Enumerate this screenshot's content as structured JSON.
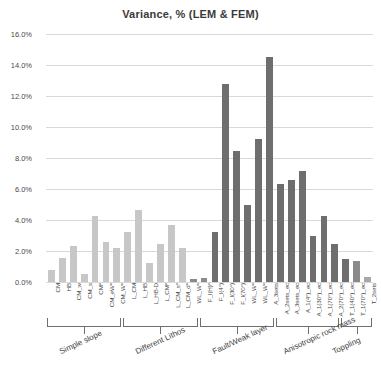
{
  "chart_data": {
    "type": "bar",
    "title": "Variance, % (LEM & FEM)",
    "xlabel": "",
    "ylabel": "",
    "ylim": [
      0,
      16
    ],
    "y_tick_labels": [
      "0.0%",
      "2.0%",
      "4.0%",
      "6.0%",
      "8.0%",
      "10.0%",
      "12.0%",
      "14.0%",
      "16.0%"
    ],
    "y_ticks": [
      0,
      2,
      4,
      6,
      8,
      10,
      12,
      14,
      16
    ],
    "grid": true,
    "legend": "none",
    "categories": [
      "CM",
      "HB",
      "CM_w",
      "CM_s",
      "CM*",
      "CM_eW*",
      "CM_W*",
      "L_CM",
      "L_HB",
      "L_HB-D",
      "L_CM*",
      "L_CM_s*",
      "L_CM_d*",
      "WL_W*",
      "F_I(H)*",
      "F_I(4°)",
      "F_I(30°)",
      "F_I(70°)",
      "WL_W*",
      "WL_W*",
      "A_3sets",
      "A_2sets_ec",
      "A_3sets_ec",
      "A_1(4°)_ec",
      "A_1(30°)_ec",
      "A_1(70°)_ec",
      "A_2(70°)_ec",
      "T_1(40°)_ec",
      "T_1(70°)_ec",
      "T_2sets"
    ],
    "values": [
      0.75,
      1.55,
      2.35,
      0.5,
      4.25,
      2.6,
      2.2,
      3.25,
      4.65,
      1.2,
      2.45,
      3.65,
      2.2,
      0.2,
      0.25,
      3.2,
      12.8,
      8.45,
      4.95,
      9.25,
      14.5,
      6.3,
      6.55,
      7.15,
      3.0,
      4.25,
      2.45,
      1.5,
      1.35,
      0.35
    ],
    "bar_colors": [
      "#c7c7c7",
      "#c7c7c7",
      "#c7c7c7",
      "#c7c7c7",
      "#c7c7c7",
      "#c7c7c7",
      "#c7c7c7",
      "#c7c7c7",
      "#c7c7c7",
      "#c7c7c7",
      "#c7c7c7",
      "#c7c7c7",
      "#c7c7c7",
      "#8a8a8a",
      "#8a8a8a",
      "#6e6e6e",
      "#6e6e6e",
      "#6e6e6e",
      "#6e6e6e",
      "#6e6e6e",
      "#6e6e6e",
      "#6e6e6e",
      "#6e6e6e",
      "#6e6e6e",
      "#6e6e6e",
      "#6e6e6e",
      "#6e6e6e",
      "#6e6e6e",
      "#8a8a8a",
      "#a8a8a8"
    ],
    "groups": [
      {
        "label": "Simple slope",
        "start": 0,
        "end": 6
      },
      {
        "label": "Different Lithos",
        "start": 7,
        "end": 13
      },
      {
        "label": "Fault/Weak layer",
        "start": 14,
        "end": 20
      },
      {
        "label": "Anisotropic rock mass",
        "start": 21,
        "end": 26
      },
      {
        "label": "Toppling",
        "start": 27,
        "end": 29
      }
    ]
  }
}
